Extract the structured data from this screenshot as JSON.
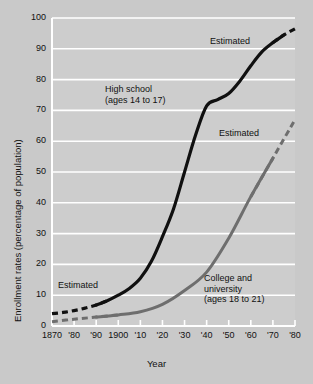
{
  "chart_data": {
    "type": "line",
    "title": "",
    "xlabel": "Year",
    "ylabel": "Enrollment rates (percentage of population)",
    "xlim": [
      1870,
      1980
    ],
    "ylim": [
      0,
      100
    ],
    "grid": true,
    "legend_position": "inline-annotations",
    "x_tick_labels": [
      "1870",
      "'80",
      "'90",
      "1900",
      "'10",
      "'20",
      "'30",
      "'40",
      "'50",
      "'60",
      "'70",
      "'80"
    ],
    "x_tick_values": [
      1870,
      1880,
      1890,
      1900,
      1910,
      1920,
      1930,
      1940,
      1950,
      1960,
      1970,
      1980
    ],
    "y_tick_labels": [
      "0",
      "10",
      "20",
      "30",
      "40",
      "50",
      "60",
      "70",
      "80",
      "90",
      "100"
    ],
    "y_tick_values": [
      0,
      10,
      20,
      30,
      40,
      50,
      60,
      70,
      80,
      90,
      100
    ],
    "series": [
      {
        "name": "High school (ages 14 to 17)",
        "color": "#101010",
        "width": 3.2,
        "x": [
          1870,
          1875,
          1880,
          1885,
          1890,
          1895,
          1900,
          1905,
          1910,
          1915,
          1920,
          1925,
          1930,
          1935,
          1940,
          1945,
          1950,
          1955,
          1960,
          1965,
          1970,
          1975,
          1980
        ],
        "values": [
          4.0,
          4.4,
          5.0,
          5.8,
          6.8,
          8.2,
          10.0,
          12.2,
          15.5,
          21.0,
          29.0,
          38.0,
          50.0,
          62.0,
          71.5,
          73.5,
          75.5,
          79.5,
          84.5,
          89.0,
          92.0,
          94.5,
          96.5
        ],
        "dashed_ranges": [
          [
            1870,
            1890
          ],
          [
            1970,
            1980
          ]
        ]
      },
      {
        "name": "College and university (ages 18 to 21)",
        "color": "#6e6e6e",
        "width": 3.0,
        "x": [
          1870,
          1880,
          1890,
          1900,
          1910,
          1920,
          1930,
          1940,
          1950,
          1960,
          1970,
          1980
        ],
        "values": [
          1.4,
          2.2,
          2.9,
          3.6,
          4.6,
          7.0,
          11.5,
          17.5,
          28.5,
          42.0,
          54.5,
          67.0
        ],
        "dashed_ranges": [
          [
            1870,
            1890
          ],
          [
            1960,
            1980
          ]
        ]
      }
    ],
    "annotations": [
      {
        "name": "high-school-series-label",
        "text": "High school\n(ages 14 to 17)",
        "line1": "High school",
        "line2": "(ages 14 to 17)",
        "x_px": 105,
        "y_px": 84
      },
      {
        "name": "college-series-label",
        "text": "College and\nuniversity\n(ages 18 to 21)",
        "line1": "College and",
        "line2": "university",
        "line3": "(ages 18 to 21)",
        "x_px": 204,
        "y_px": 273
      },
      {
        "name": "estimated-high-school-early",
        "text": "Estimated",
        "x_px": 58,
        "y_px": 280
      },
      {
        "name": "estimated-high-school-late",
        "text": "Estimated",
        "x_px": 210,
        "y_px": 36
      },
      {
        "name": "estimated-college-late",
        "text": "Estimated",
        "x_px": 219,
        "y_px": 128
      }
    ],
    "colors": {
      "background": "#c9c9c9",
      "plot_background": "#cdcdcd",
      "gridline": "#ffffff",
      "axis": "#ffffff",
      "text": "#111111",
      "high_school_line": "#101010",
      "college_line": "#6e6e6e"
    }
  }
}
